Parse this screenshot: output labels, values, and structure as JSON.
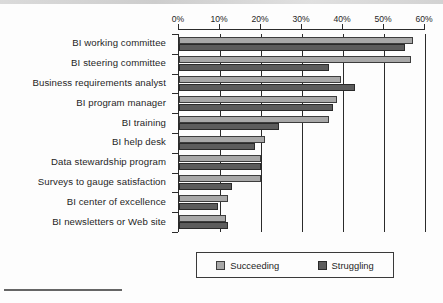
{
  "chart_data": {
    "type": "bar",
    "orientation": "horizontal",
    "title": "",
    "xlabel": "",
    "ylabel": "",
    "xlim": [
      0,
      60
    ],
    "xticks": [
      "0%",
      "10%",
      "20%",
      "30%",
      "40%",
      "50%",
      "60%"
    ],
    "xtick_values": [
      0,
      10,
      20,
      30,
      40,
      50,
      60
    ],
    "grid": true,
    "legend_position": "bottom",
    "categories": [
      "BI working committee",
      "BI steering committee",
      "Business requirements analyst",
      "BI program manager",
      "BI training",
      "BI help desk",
      "Data stewardship program",
      "Surveys to gauge satisfaction",
      "BI center of excellence",
      "BI newsletters or Web site"
    ],
    "series": [
      {
        "name": "Succeeding",
        "color": "#a8a8a8",
        "values": [
          57,
          56.5,
          39.5,
          38.5,
          36.5,
          21,
          20,
          20,
          12,
          11.5
        ]
      },
      {
        "name": "Struggling",
        "color": "#5c5c5c",
        "values": [
          55,
          36.5,
          43,
          37.5,
          24.5,
          18.5,
          20,
          13,
          9.5,
          12
        ]
      }
    ]
  },
  "legend": {
    "items": [
      {
        "label": "Succeeding",
        "swatch": "succeeding-swatch"
      },
      {
        "label": "Struggling",
        "swatch": "struggling-swatch"
      }
    ]
  }
}
